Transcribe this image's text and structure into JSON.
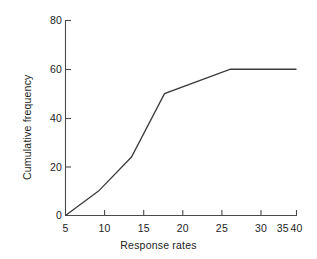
{
  "figure": {
    "background_color": "#ffffff",
    "line_color": "#3c3c3c",
    "axis_color": "#4a4a4a",
    "text_color": "#232323"
  },
  "chart_data": {
    "type": "line",
    "title": "",
    "subtitle": "",
    "xlabel": "Response rates",
    "ylabel": "Cumulative frequency",
    "xlim": [
      5,
      40
    ],
    "ylim": [
      0,
      80
    ],
    "xticks": [
      5,
      10,
      15,
      20,
      25,
      30,
      35,
      40
    ],
    "xtick_labels": [
      "5",
      "10",
      "15",
      "20",
      "25",
      "30",
      "35",
      "40"
    ],
    "yticks": [
      0,
      20,
      40,
      60,
      80
    ],
    "ytick_labels": [
      "0",
      "20",
      "40",
      "60",
      "80"
    ],
    "grid": false,
    "legend": null,
    "legend_position": "none",
    "annotations": [],
    "series": [
      {
        "name": "Cumulative frequency",
        "x": [
          5,
          10,
          15,
          20,
          30,
          40
        ],
        "values": [
          0,
          10,
          24,
          50,
          60,
          60
        ]
      }
    ]
  }
}
